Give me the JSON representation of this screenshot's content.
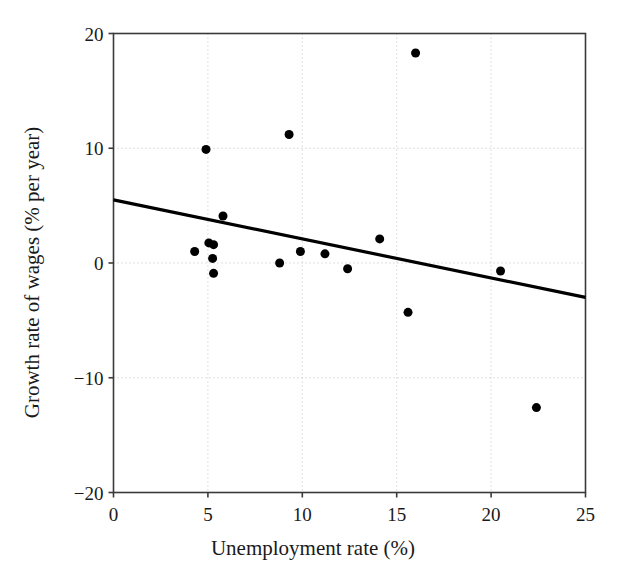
{
  "chart_data": {
    "type": "scatter",
    "title": "",
    "xlabel": "Unemployment rate (%)",
    "ylabel": "Growth rate of wages (% per year)",
    "xlim": [
      0,
      25
    ],
    "ylim": [
      -20,
      20
    ],
    "xticks": [
      0,
      5,
      10,
      15,
      20,
      25
    ],
    "yticks": [
      -20,
      -10,
      0,
      10,
      20
    ],
    "xtick_labels": [
      "0",
      "5",
      "10",
      "15",
      "20",
      "25"
    ],
    "ytick_labels": [
      "−20",
      "−10",
      "0",
      "10",
      "20"
    ],
    "grid": true,
    "grid_style": "dotted",
    "grid_color": "#bfbfbf",
    "legend": false,
    "marker": "filled-circle",
    "marker_color": "#000000",
    "marker_size": 9,
    "axis_color": "#3a3a3a",
    "background": "#ffffff",
    "points": [
      {
        "x": 4.3,
        "y": 1.0
      },
      {
        "x": 4.9,
        "y": 9.9
      },
      {
        "x": 5.05,
        "y": 1.75
      },
      {
        "x": 5.3,
        "y": 1.6
      },
      {
        "x": 5.25,
        "y": 0.4
      },
      {
        "x": 5.3,
        "y": -0.9
      },
      {
        "x": 5.8,
        "y": 4.1
      },
      {
        "x": 8.8,
        "y": 0.0
      },
      {
        "x": 9.3,
        "y": 11.2
      },
      {
        "x": 9.9,
        "y": 1.0
      },
      {
        "x": 11.2,
        "y": 0.8
      },
      {
        "x": 12.4,
        "y": -0.5
      },
      {
        "x": 14.1,
        "y": 2.1
      },
      {
        "x": 15.6,
        "y": -4.3
      },
      {
        "x": 16.0,
        "y": 18.3
      },
      {
        "x": 20.5,
        "y": -0.7
      },
      {
        "x": 22.4,
        "y": -12.6
      }
    ],
    "trendline": {
      "type": "linear-fit",
      "x_start": 0,
      "y_start": 5.5,
      "x_end": 25,
      "y_end": -3.0,
      "color": "#000000",
      "width": 3.2
    }
  }
}
